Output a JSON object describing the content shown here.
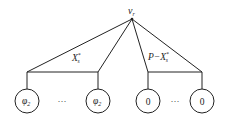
{
  "diagram": {
    "root": {
      "label": "v",
      "sub": "r"
    },
    "edge_labels": {
      "left": {
        "main": "X",
        "sub": "s",
        "sup": "*"
      },
      "right": {
        "prefix": "P−",
        "main": "X",
        "sub": "s",
        "sup": "*"
      }
    },
    "leaves": [
      {
        "label": "φ",
        "sub": "2"
      },
      {
        "label": "φ",
        "sub": "2"
      },
      {
        "label": "0",
        "sub": ""
      },
      {
        "label": "0",
        "sub": ""
      }
    ],
    "ellipsis": "···",
    "colors": {
      "stroke": "#222222",
      "background": "#ffffff"
    }
  }
}
